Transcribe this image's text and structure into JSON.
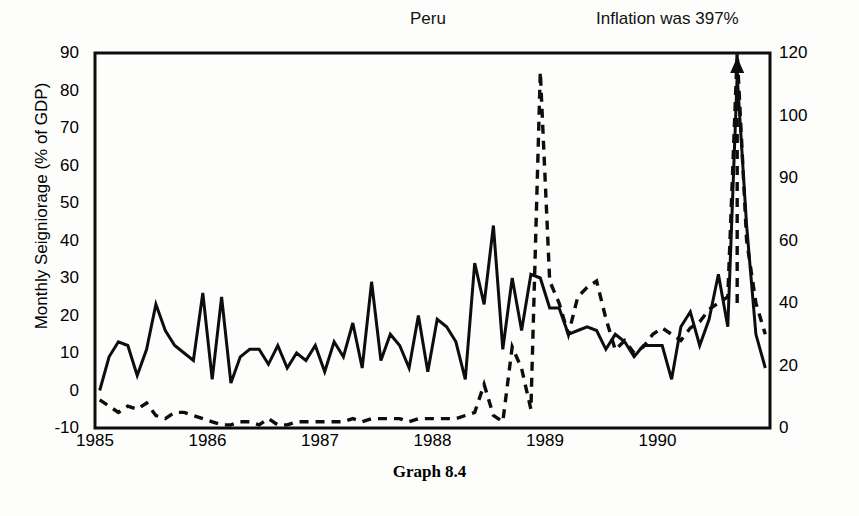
{
  "figure": {
    "caption": "Graph 8.4",
    "title": "Peru",
    "annotation": "Inflation was 397%"
  },
  "axes": {
    "left_label": "Monthly Seigniorage (% of GDP)",
    "right_label": "Monthly Inflation (%)",
    "left_ticks": [
      "90",
      "80",
      "70",
      "60",
      "50",
      "40",
      "30",
      "20",
      "10",
      "0",
      "-10"
    ],
    "right_ticks": [
      "120",
      "100",
      "90",
      "60",
      "40",
      "20",
      "0"
    ],
    "x_ticks": [
      "1985",
      "1986",
      "1987",
      "1988",
      "1989",
      "1990"
    ]
  },
  "colors": {
    "line": "#0d0d0d",
    "frame": "#0d0d0d",
    "background": "#fdfdfc"
  },
  "chart_data": {
    "type": "line",
    "title": "Peru",
    "subtitle": "Graph 8.4",
    "xlabel": "",
    "ylabel": "Monthly Seigniorage (% of GDP)",
    "y2label": "Monthly Inflation (%)",
    "ylim": [
      -10,
      90
    ],
    "y2lim": [
      0,
      120
    ],
    "xlim": [
      "1985-01",
      "1990-12"
    ],
    "grid": false,
    "legend": "none",
    "annotations": [
      {
        "text": "Peru",
        "x": "1988-06",
        "note": "country title above plot"
      },
      {
        "text": "Inflation was 397%",
        "x": "1990-06",
        "note": "dashed series exceeds axis; arrow points up"
      }
    ],
    "yticks": [
      -10,
      0,
      10,
      20,
      30,
      40,
      50,
      60,
      70,
      80,
      90
    ],
    "y2ticks": [
      0,
      20,
      40,
      60,
      90,
      100,
      120
    ],
    "y2ticks_note": "printed label sequence on right axis reads 0, 20, 40, 60, 90, 100, 120",
    "x": [
      "1985-01",
      "1985-02",
      "1985-03",
      "1985-04",
      "1985-05",
      "1985-06",
      "1985-07",
      "1985-08",
      "1985-09",
      "1985-10",
      "1985-11",
      "1985-12",
      "1986-01",
      "1986-02",
      "1986-03",
      "1986-04",
      "1986-05",
      "1986-06",
      "1986-07",
      "1986-08",
      "1986-09",
      "1986-10",
      "1986-11",
      "1986-12",
      "1987-01",
      "1987-02",
      "1987-03",
      "1987-04",
      "1987-05",
      "1987-06",
      "1987-07",
      "1987-08",
      "1987-09",
      "1987-10",
      "1987-11",
      "1987-12",
      "1988-01",
      "1988-02",
      "1988-03",
      "1988-04",
      "1988-05",
      "1988-06",
      "1988-07",
      "1988-08",
      "1988-09",
      "1988-10",
      "1988-11",
      "1988-12",
      "1989-01",
      "1989-02",
      "1989-03",
      "1989-04",
      "1989-05",
      "1989-06",
      "1989-07",
      "1989-08",
      "1989-09",
      "1989-10",
      "1989-11",
      "1989-12",
      "1990-01",
      "1990-02",
      "1990-03",
      "1990-04",
      "1990-05",
      "1990-06",
      "1990-07",
      "1990-08",
      "1990-09",
      "1990-10",
      "1990-11",
      "1990-12"
    ],
    "series": [
      {
        "name": "Monthly Seigniorage (% of GDP)",
        "axis": "left",
        "style": "solid",
        "values": [
          0,
          9,
          13,
          12,
          4,
          11,
          23,
          16,
          12,
          10,
          8,
          26,
          3,
          25,
          2,
          9,
          11,
          11,
          7,
          12,
          6,
          10,
          8,
          12,
          5,
          13,
          9,
          18,
          6,
          29,
          8,
          15,
          12,
          6,
          20,
          5,
          19,
          17,
          13,
          3,
          34,
          23,
          44,
          11,
          30,
          16,
          31,
          30,
          22,
          22,
          15,
          16,
          17,
          16,
          11,
          15,
          13,
          9,
          12,
          12,
          12,
          3,
          17,
          21,
          12,
          19,
          31,
          17,
          84,
          44,
          15,
          6
        ]
      },
      {
        "name": "Monthly Inflation (%)",
        "axis": "right",
        "style": "dashed",
        "values": [
          9,
          7,
          5,
          7,
          6,
          8,
          4,
          3,
          5,
          5,
          4,
          3,
          2,
          1,
          1,
          2,
          2,
          1,
          3,
          1,
          1,
          2,
          2,
          2,
          2,
          2,
          2,
          3,
          2,
          3,
          3,
          3,
          3,
          2,
          3,
          3,
          3,
          3,
          3,
          4,
          5,
          14,
          4,
          2,
          26,
          19,
          6,
          114,
          47,
          40,
          30,
          42,
          45,
          47,
          35,
          25,
          28,
          24,
          26,
          30,
          32,
          30,
          28,
          32,
          34,
          38,
          40,
          42,
          397,
          60,
          40,
          30
        ],
        "note": "September 1990 value of 397% is off-scale and marked with an upward arrow"
      }
    ]
  }
}
